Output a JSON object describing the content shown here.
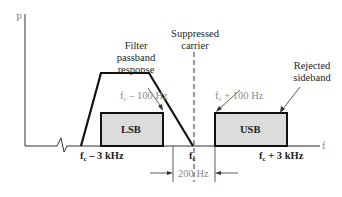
{
  "diagram": {
    "axis": {
      "y_label": "P",
      "x_label": "f"
    },
    "labels": {
      "filter": [
        "Filter",
        "passband",
        "response"
      ],
      "carrier": [
        "Suppressed",
        "carrier"
      ],
      "rejected": [
        "Rejected",
        "sideband"
      ],
      "lsb": "LSB",
      "usb": "USB",
      "fc_minus_100": {
        "base": "f",
        "sub": "c",
        "rest": " – 100 Hz"
      },
      "fc_plus_100": {
        "base": "f",
        "sub": "c",
        "rest": " + 100 Hz"
      },
      "fc_minus_3k": {
        "base": "f",
        "sub": "c",
        "rest": " – 3 kHz"
      },
      "fc": {
        "base": "f",
        "sub": "c",
        "rest": ""
      },
      "fc_plus_3k": {
        "base": "f",
        "sub": "c",
        "rest": " + 3 kHz"
      },
      "gap": "200 Hz"
    },
    "colors": {
      "line": "#111111",
      "sideband_fill": "#dcdcdc",
      "axis": "#555555",
      "annotation_gray": "#8a8a8a"
    }
  }
}
